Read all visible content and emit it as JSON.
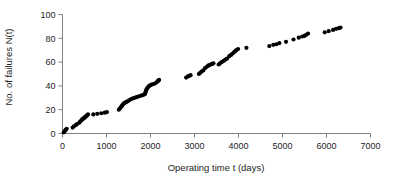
{
  "chart_data": {
    "type": "scatter",
    "title": "",
    "xlabel": "Operating time t (days)",
    "ylabel": "No. of failures N(t)",
    "xlim": [
      0,
      7000
    ],
    "ylim": [
      0,
      100
    ],
    "xticks": [
      0,
      1000,
      2000,
      3000,
      4000,
      5000,
      6000,
      7000
    ],
    "yticks": [
      0,
      20,
      40,
      60,
      80,
      100
    ],
    "xtick_labels": [
      "0",
      "1000",
      "2000",
      "3000",
      "4000",
      "5000",
      "6000",
      "7000"
    ],
    "ytick_labels": [
      "0",
      "20",
      "40",
      "60",
      "80",
      "100"
    ],
    "grid": false,
    "legend": null,
    "marker": "filled-circle",
    "marker_color": "#000000",
    "marker_size": 2.1,
    "axis_color": "#808080",
    "series": [
      {
        "name": "Cumulative failures",
        "x": [
          30,
          55,
          70,
          95,
          230,
          260,
          300,
          330,
          380,
          400,
          430,
          450,
          470,
          490,
          505,
          520,
          535,
          550,
          565,
          580,
          700,
          790,
          880,
          960,
          1010,
          1280,
          1305,
          1325,
          1345,
          1365,
          1385,
          1405,
          1425,
          1450,
          1480,
          1520,
          1560,
          1600,
          1640,
          1680,
          1720,
          1760,
          1800,
          1840,
          1870,
          1880,
          1890,
          1900,
          1910,
          1925,
          1945,
          1970,
          1995,
          2020,
          2060,
          2100,
          2140,
          2165,
          2180,
          2195,
          2810,
          2850,
          2880,
          2910,
          3100,
          3130,
          3160,
          3200,
          3240,
          3280,
          3310,
          3340,
          3370,
          3400,
          3430,
          3550,
          3580,
          3620,
          3660,
          3700,
          3740,
          3790,
          3830,
          3860,
          3890,
          3920,
          3950,
          3990,
          4180,
          4700,
          4790,
          4860,
          4930,
          5080,
          5250,
          5370,
          5450,
          5500,
          5540,
          5580,
          5960,
          6050,
          6150,
          6220,
          6280,
          6320
        ],
        "y": [
          1,
          2,
          3,
          4,
          5,
          6,
          7,
          8,
          9,
          10,
          11,
          12,
          12.5,
          13,
          13.5,
          14,
          14.5,
          15,
          15.5,
          16,
          16,
          16.5,
          17,
          17.5,
          18,
          20,
          21,
          22,
          23,
          24,
          25,
          25.5,
          26,
          26.5,
          27,
          28,
          29,
          29.5,
          30,
          30.5,
          31,
          31.5,
          32,
          32.5,
          33,
          34,
          35,
          36,
          37,
          38,
          39,
          40,
          40.5,
          41,
          41.5,
          42,
          43,
          44,
          44.5,
          45,
          47,
          48,
          48.5,
          49,
          50,
          51,
          52,
          53,
          55,
          56,
          57,
          57.5,
          58,
          58.5,
          59,
          58,
          59,
          60,
          61,
          62,
          63,
          65,
          66,
          67,
          68,
          69,
          70,
          71,
          72,
          73.5,
          74.5,
          75,
          76,
          77,
          79,
          80.5,
          81.5,
          82,
          83,
          84,
          85,
          86,
          87,
          88,
          88.5,
          89
        ]
      }
    ]
  }
}
